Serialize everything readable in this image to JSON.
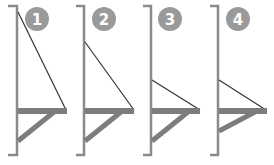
{
  "colors": {
    "wall": "#8a8a8a",
    "badge": "#9a9a9a",
    "shelf": "#7d7d7d",
    "tie": "#333333"
  },
  "panels": [
    {
      "label": "1",
      "wall_x": 17,
      "tie_top_y": 12,
      "tie_end_x": 66,
      "brace_bottom_y": 143
    },
    {
      "label": "2",
      "wall_x": 84,
      "tie_top_y": 42,
      "tie_end_x": 134,
      "brace_bottom_y": 143
    },
    {
      "label": "3",
      "wall_x": 151,
      "tie_top_y": 80,
      "tie_end_x": 200,
      "brace_bottom_y": 143
    },
    {
      "label": "4",
      "wall_x": 218,
      "tie_top_y": 80,
      "tie_end_x": 266,
      "brace_bottom_y": 133
    }
  ]
}
